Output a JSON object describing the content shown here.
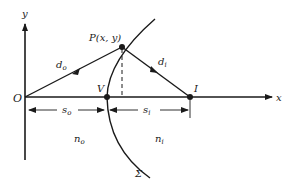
{
  "diagram": {
    "axes": {
      "x_label": "x",
      "y_label": "y",
      "origin_label": "O"
    },
    "points": {
      "P": "P(x, y)",
      "V": "V",
      "I": "I"
    },
    "rays": {
      "object_distance": "d",
      "object_distance_sub": "o",
      "image_distance": "d",
      "image_distance_sub": "i"
    },
    "dimensions": {
      "s_object": "s",
      "s_object_sub": "o",
      "s_image": "s",
      "s_image_sub": "i"
    },
    "media": {
      "n_object": "n",
      "n_object_sub": "o",
      "n_image": "n",
      "n_image_sub": "i"
    },
    "surface_label": "Σ",
    "colors": {
      "ink": "#1a1a1a",
      "background": "#ffffff"
    }
  }
}
